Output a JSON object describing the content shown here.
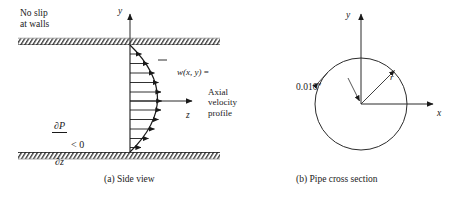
{
  "figure": {
    "panel_a": {
      "caption": "(a) Side view",
      "no_slip_label": "No slip\nat walls",
      "pressure_gradient": {
        "numerator": "∂P",
        "denominator": "∂z",
        "relation": "< 0"
      },
      "velocity_label": {
        "function": "w(x, y)",
        "equals": "=",
        "description": "Axial\nvelocity\nprofile"
      },
      "axis_y_label": "y",
      "axis_z_label": "z",
      "arrow_count": 11
    },
    "panel_b": {
      "caption": "(b) Pipe cross section",
      "axis_y_label": "y",
      "axis_x_label": "x",
      "radius_label": "r",
      "diameter_label": "0.010″"
    },
    "colors": {
      "ink": "#1a1a1a",
      "line": "#2b2b2b",
      "hatch": "#3a3a3a",
      "background": "#ffffff"
    }
  }
}
